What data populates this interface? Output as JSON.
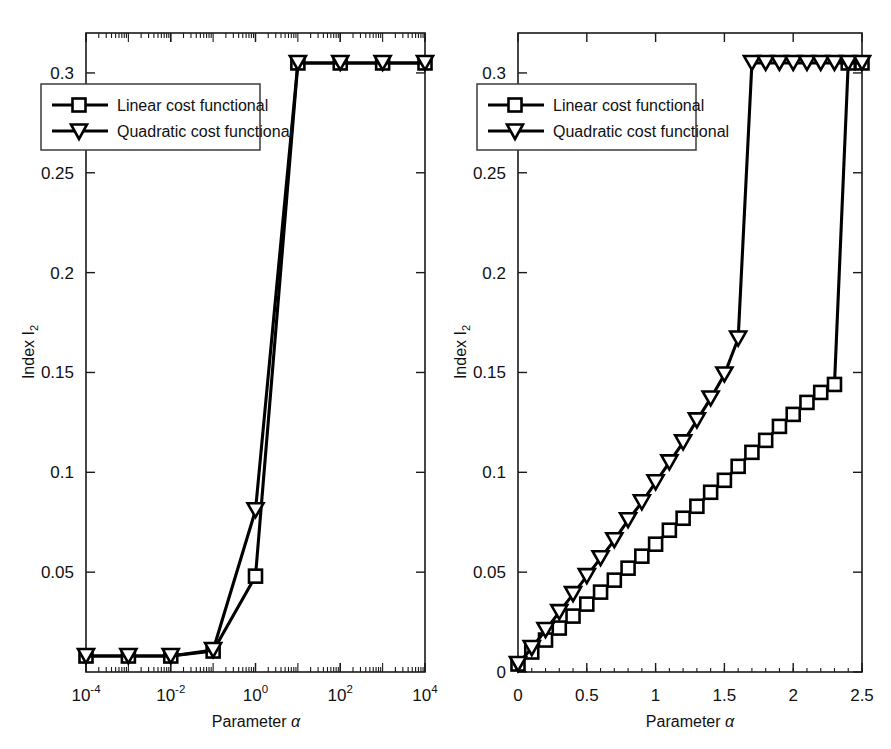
{
  "figure": {
    "background": "#ffffff",
    "foreground": "#000000"
  },
  "legend": {
    "linear_label": "Linear cost functional",
    "quadratic_label": "Quadratic cost functional",
    "linear_marker": "square-marker",
    "quadratic_marker": "down-triangle-marker"
  },
  "labels": {
    "xlabel_text": "Parameter",
    "xlabel_symbol": "α",
    "ylabel_text": "Index I",
    "ylabel_sub": "2"
  },
  "chart_data": [
    {
      "type": "line",
      "id": "left-panel",
      "title": "",
      "xlabel": "Parameter α",
      "ylabel": "Index I_2",
      "xscale": "log",
      "yscale": "linear",
      "xlim": [
        0.0001,
        10000
      ],
      "ylim": [
        0.0,
        0.32
      ],
      "xticks": [
        0.0001,
        0.01,
        1,
        100,
        10000
      ],
      "xticklabels": [
        "10-4",
        "10-2",
        "100",
        "102",
        "104"
      ],
      "xtick_mantissa": [
        "10",
        "10",
        "10",
        "10",
        "10"
      ],
      "xtick_exponent": [
        "-4",
        "-2",
        "0",
        "2",
        "4"
      ],
      "yticks": [
        0.05,
        0.1,
        0.15,
        0.2,
        0.25,
        0.3
      ],
      "yticklabels": [
        "0.05",
        "0.1",
        "0.15",
        "0.2",
        "0.25",
        "0.3"
      ],
      "grid": false,
      "legend_position": "upper-left",
      "series": [
        {
          "name": "Linear cost functional",
          "marker": "square",
          "x": [
            0.0001,
            0.001,
            0.01,
            0.1,
            1,
            10,
            100,
            1000,
            10000
          ],
          "values": [
            0.008,
            0.008,
            0.008,
            0.0105,
            0.048,
            0.305,
            0.305,
            0.305,
            0.305
          ]
        },
        {
          "name": "Quadratic cost functional",
          "marker": "triangle-down",
          "x": [
            0.0001,
            0.001,
            0.01,
            0.1,
            1,
            10,
            100,
            1000,
            10000
          ],
          "values": [
            0.008,
            0.008,
            0.008,
            0.011,
            0.081,
            0.305,
            0.305,
            0.305,
            0.305
          ]
        }
      ]
    },
    {
      "type": "line",
      "id": "right-panel",
      "title": "",
      "xlabel": "Parameter α",
      "ylabel": "Index I_2",
      "xscale": "linear",
      "yscale": "linear",
      "xlim": [
        0.0,
        2.5
      ],
      "ylim": [
        0.0,
        0.32
      ],
      "xticks": [
        0,
        0.5,
        1,
        1.5,
        2,
        2.5
      ],
      "xticklabels": [
        "0",
        "0.5",
        "1",
        "1.5",
        "2",
        "2.5"
      ],
      "yticks": [
        0,
        0.05,
        0.1,
        0.15,
        0.2,
        0.25,
        0.3
      ],
      "yticklabels": [
        "0",
        "0.05",
        "0.1",
        "0.15",
        "0.2",
        "0.25",
        "0.3"
      ],
      "grid": false,
      "legend_position": "upper-left",
      "series": [
        {
          "name": "Linear cost functional",
          "marker": "square",
          "x": [
            0.0,
            0.1,
            0.2,
            0.3,
            0.4,
            0.5,
            0.6,
            0.7,
            0.8,
            0.9,
            1.0,
            1.1,
            1.2,
            1.3,
            1.4,
            1.5,
            1.6,
            1.7,
            1.8,
            1.9,
            2.0,
            2.1,
            2.2,
            2.3,
            2.4,
            2.5
          ],
          "values": [
            0.004,
            0.01,
            0.016,
            0.022,
            0.028,
            0.034,
            0.04,
            0.046,
            0.052,
            0.058,
            0.064,
            0.071,
            0.077,
            0.083,
            0.09,
            0.096,
            0.103,
            0.11,
            0.116,
            0.123,
            0.129,
            0.135,
            0.14,
            0.144,
            0.305,
            0.305
          ]
        },
        {
          "name": "Quadratic cost functional",
          "marker": "triangle-down",
          "x": [
            0.0,
            0.1,
            0.2,
            0.3,
            0.4,
            0.5,
            0.6,
            0.7,
            0.8,
            0.9,
            1.0,
            1.1,
            1.2,
            1.3,
            1.4,
            1.5,
            1.6,
            1.7,
            1.8,
            1.9,
            2.0,
            2.1,
            2.2,
            2.3,
            2.4,
            2.5
          ],
          "values": [
            0.004,
            0.012,
            0.021,
            0.03,
            0.039,
            0.048,
            0.057,
            0.066,
            0.076,
            0.085,
            0.095,
            0.105,
            0.115,
            0.126,
            0.137,
            0.149,
            0.167,
            0.305,
            0.305,
            0.305,
            0.305,
            0.305,
            0.305,
            0.305,
            0.305,
            0.305
          ]
        }
      ]
    }
  ]
}
